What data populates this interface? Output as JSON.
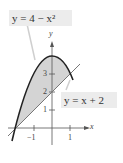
{
  "diagram": {
    "curve_label": "y = 4 − x²",
    "line_label": "y = x + 2",
    "x_axis_label": "x",
    "y_axis_label": "y",
    "x_ticks": [
      "−1",
      "1"
    ],
    "y_ticks": [
      "1",
      "2",
      "3"
    ],
    "colors": {
      "shade": "#d4d4d4",
      "curve": "#222222",
      "line": "#666666",
      "axis": "#555555",
      "label_bg": "#ececec"
    }
  }
}
